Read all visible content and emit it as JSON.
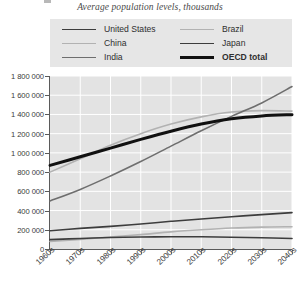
{
  "subtitle": "Average population levels, thousands",
  "legend": {
    "columns": [
      [
        {
          "label": "United States",
          "color": "#3d3d3d",
          "width": 1.6,
          "bold": false
        },
        {
          "label": "China",
          "color": "#b2b2b2",
          "width": 1.6,
          "bold": false
        },
        {
          "label": "India",
          "color": "#6e6e6e",
          "width": 1.6,
          "bold": false
        }
      ],
      [
        {
          "label": "Brazil",
          "color": "#b2b2b2",
          "width": 1.6,
          "bold": false
        },
        {
          "label": "Japan",
          "color": "#3d3d3d",
          "width": 1.6,
          "bold": false
        },
        {
          "label": "OECD total",
          "color": "#111111",
          "width": 3.0,
          "bold": true
        }
      ]
    ]
  },
  "chart_data": {
    "type": "line",
    "title": "",
    "subtitle": "Average population levels, thousands",
    "xlabel": "",
    "ylabel": "",
    "categories": [
      "1960s",
      "1970s",
      "1980s",
      "1990s",
      "2000s",
      "2010s",
      "2020s",
      "2030s",
      "2040s"
    ],
    "ylim": [
      0,
      1800000
    ],
    "ytick_labels": [
      "1 800 000",
      "1 600 000",
      "1 400 000",
      "1 200 000",
      "1 000 000",
      "800 000",
      "600 000",
      "400 000",
      "200 000",
      "0"
    ],
    "ytick_values": [
      1800000,
      1600000,
      1400000,
      1200000,
      1000000,
      800000,
      600000,
      400000,
      200000,
      0
    ],
    "grid": true,
    "grid_color": "#ffffff",
    "plot_background": "#e3e3e3",
    "legend_position": "top",
    "series": [
      {
        "name": "United States",
        "color": "#3d3d3d",
        "width": 1.6,
        "values": [
          190000,
          215000,
          235000,
          260000,
          288000,
          312000,
          336000,
          358000,
          378000
        ]
      },
      {
        "name": "China",
        "color": "#b2b2b2",
        "width": 1.6,
        "values": [
          800000,
          940000,
          1080000,
          1200000,
          1300000,
          1375000,
          1425000,
          1440000,
          1435000
        ]
      },
      {
        "name": "India",
        "color": "#6e6e6e",
        "width": 1.6,
        "values": [
          500000,
          620000,
          760000,
          910000,
          1070000,
          1230000,
          1380000,
          1520000,
          1690000
        ]
      },
      {
        "name": "Brazil",
        "color": "#b2b2b2",
        "width": 1.6,
        "values": [
          78000,
          100000,
          125000,
          150000,
          178000,
          200000,
          218000,
          228000,
          232000
        ]
      },
      {
        "name": "Japan",
        "color": "#3d3d3d",
        "width": 1.6,
        "values": [
          98000,
          110000,
          120000,
          125000,
          127000,
          127000,
          123000,
          117000,
          110000
        ]
      },
      {
        "name": "OECD total",
        "color": "#111111",
        "width": 3.0,
        "values": [
          870000,
          960000,
          1050000,
          1140000,
          1225000,
          1300000,
          1355000,
          1385000,
          1398000
        ]
      }
    ]
  }
}
